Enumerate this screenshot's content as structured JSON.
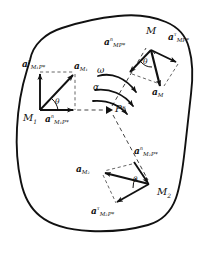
{
  "figure": {
    "ink_color": "#111111",
    "background": "#ffffff",
    "outline_name": "rigid-body-outline"
  },
  "points": {
    "pole": {
      "name": "P",
      "star": "*"
    },
    "m": {
      "name": "M"
    },
    "m1": {
      "name": "M",
      "sub": "1"
    },
    "m2": {
      "name": "M",
      "sub": "2"
    }
  },
  "rotation": {
    "omega": "ω",
    "alpha": "α"
  },
  "angles": {
    "theta_m": "θ",
    "theta_m1": "θ",
    "theta_m2": "θ"
  },
  "vectors": {
    "a_m": {
      "sym": "a",
      "sup": "",
      "sub": "M"
    },
    "a_m_n": {
      "sym": "a",
      "sup": "n",
      "sub": "MP*"
    },
    "a_m_t": {
      "sym": "a",
      "sup": "τ",
      "sub": "MP*"
    },
    "a_m1": {
      "sym": "a",
      "sup": "",
      "sub": "M₁"
    },
    "a_m1_n": {
      "sym": "a",
      "sup": "n",
      "sub": "M₁P*"
    },
    "a_m1_t": {
      "sym": "a",
      "sup": "τ",
      "sub": "M₁P*"
    },
    "a_m2": {
      "sym": "a",
      "sup": "",
      "sub": "M₂"
    },
    "a_m2_n": {
      "sym": "a",
      "sup": "n",
      "sub": "M₂P*"
    },
    "a_m2_t": {
      "sym": "a",
      "sup": "τ",
      "sub": "M₂P*"
    }
  }
}
